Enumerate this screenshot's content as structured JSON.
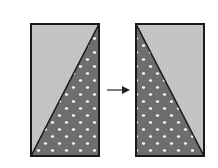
{
  "diagram": {
    "colors": {
      "background": "#ffffff",
      "light_fill": "#c4c4c4",
      "dark_fill": "#6e6e6e",
      "dot": "#ffffff",
      "stroke": "#1a1a1a"
    },
    "left_figure": {
      "x": 30,
      "y": 23,
      "width": 70,
      "height": 134,
      "diagonal": "bottom-left to top-right",
      "dotted_region": "lower-right triangle"
    },
    "arrow": {
      "x1": 107,
      "y1": 90,
      "x2": 130,
      "y2": 90
    },
    "right_figure": {
      "x": 135,
      "y": 23,
      "width": 70,
      "height": 134,
      "diagonal": "top-left to bottom-right",
      "dotted_region": "lower-left triangle"
    }
  }
}
